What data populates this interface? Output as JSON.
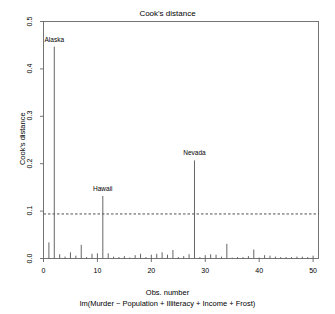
{
  "chart_data": {
    "type": "bar",
    "title": "Cook's distance",
    "xlabel": "Obs. number",
    "sublabel": "lm(Murder ~ Population + Illiteracy + Income + Frost)",
    "ylabel": "Cook's distance",
    "xlim": [
      0,
      51
    ],
    "ylim": [
      0.0,
      0.5
    ],
    "grid": false,
    "legend": null,
    "x_ticks": [
      "0",
      "10",
      "20",
      "30",
      "40",
      "50"
    ],
    "x_tick_values": [
      0,
      10,
      20,
      30,
      40,
      50
    ],
    "y_ticks": [
      "0.0",
      "0.1",
      "0.2",
      "0.3",
      "0.4",
      "0.5"
    ],
    "y_tick_values": [
      0.0,
      0.1,
      0.2,
      0.3,
      0.4,
      0.5
    ],
    "cutoff_line": {
      "value": 0.094,
      "style": "dashed",
      "orientation": "horizontal"
    },
    "x": [
      1,
      2,
      3,
      4,
      5,
      6,
      7,
      8,
      9,
      10,
      11,
      12,
      13,
      14,
      15,
      16,
      17,
      18,
      19,
      20,
      21,
      22,
      23,
      24,
      25,
      26,
      27,
      28,
      29,
      30,
      31,
      32,
      33,
      34,
      35,
      36,
      37,
      38,
      39,
      40,
      41,
      42,
      43,
      44,
      45,
      46,
      47,
      48,
      49,
      50
    ],
    "values": [
      0.034,
      0.447,
      0.009,
      0.004,
      0.013,
      0.006,
      0.029,
      0.003,
      0.01,
      0.011,
      0.132,
      0.011,
      0.004,
      0.003,
      0.005,
      0.002,
      0.007,
      0.01,
      0.003,
      0.008,
      0.01,
      0.013,
      0.008,
      0.018,
      0.003,
      0.005,
      0.009,
      0.207,
      0.003,
      0.007,
      0.009,
      0.008,
      0.004,
      0.031,
      0.002,
      0.003,
      0.003,
      0.005,
      0.019,
      0.002,
      0.007,
      0.006,
      0.004,
      0.003,
      0.003,
      0.003,
      0.004,
      0.004,
      0.003,
      0.006
    ],
    "annotations": [
      {
        "label": "Alaska",
        "x": 2,
        "y": 0.447
      },
      {
        "label": "Hawaii",
        "x": 11,
        "y": 0.132
      },
      {
        "label": "Nevada",
        "x": 28,
        "y": 0.207
      }
    ],
    "colors": {
      "background": "#ffffff",
      "foreground": "#000000",
      "bars": "#555555",
      "cutoff": "#333333",
      "frame": "#666666"
    }
  }
}
